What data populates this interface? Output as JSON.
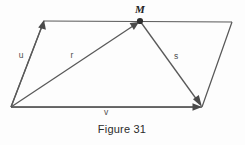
{
  "figure": {
    "caption": "Figure 31",
    "caption_position": {
      "x": 122,
      "y": 133
    },
    "canvas": {
      "width": 245,
      "height": 145
    },
    "background_color": "#fdfdfd",
    "stroke_color": "#595959",
    "label_color": "#4f4f4f",
    "point_color": "#2e2e2e",
    "type": "parallelogram-vector-diagram"
  },
  "points": {
    "origin": {
      "name": "A",
      "x": 11,
      "y": 107,
      "visible_label": ""
    },
    "top_left": {
      "name": "B",
      "x": 44,
      "y": 21,
      "visible_label": ""
    },
    "top_right": {
      "name": "C",
      "x": 232,
      "y": 22,
      "visible_label": ""
    },
    "bottom_right": {
      "name": "D",
      "x": 202,
      "y": 107,
      "visible_label": ""
    },
    "midpoint": {
      "name": "M",
      "x": 140,
      "y": 21,
      "visible_label": "M"
    }
  },
  "point_labels": [
    {
      "id": "label-M",
      "text": "M",
      "x": 140,
      "y": 13,
      "style": "italic-serif-bold"
    }
  ],
  "edges": [
    {
      "id": "edge-left",
      "from": [
        11,
        107
      ],
      "to": [
        44,
        21
      ],
      "name": "left-edge"
    },
    {
      "id": "edge-top",
      "from": [
        44,
        21
      ],
      "to": [
        232,
        22
      ],
      "name": "top-edge"
    },
    {
      "id": "edge-right",
      "from": [
        232,
        22
      ],
      "to": [
        202,
        107
      ],
      "name": "right-edge"
    },
    {
      "id": "edge-bottom",
      "from": [
        11,
        107
      ],
      "to": [
        202,
        107
      ],
      "name": "bottom-edge"
    }
  ],
  "vectors": [
    {
      "id": "vector-u",
      "label": "u",
      "from": [
        11,
        107
      ],
      "to": [
        44,
        21
      ],
      "label_x": 21,
      "label_y": 56,
      "arrow_at": "end",
      "description": "vector u from origin to top-left vertex"
    },
    {
      "id": "vector-r",
      "label": "r",
      "from": [
        11,
        107
      ],
      "to": [
        140,
        21
      ],
      "label_x": 72,
      "label_y": 56,
      "arrow_at": "end",
      "description": "vector r from origin to point M"
    },
    {
      "id": "vector-s",
      "label": "s",
      "from": [
        140,
        21
      ],
      "to": [
        202,
        107
      ],
      "label_x": 176,
      "label_y": 57,
      "arrow_at": "end",
      "description": "vector s from point M to bottom-right vertex"
    },
    {
      "id": "vector-v",
      "label": "v",
      "from": [
        11,
        107
      ],
      "to": [
        202,
        107
      ],
      "label_x": 106,
      "label_y": 113,
      "arrow_at": "end",
      "description": "vector v from origin to bottom-right vertex along bottom edge"
    }
  ]
}
